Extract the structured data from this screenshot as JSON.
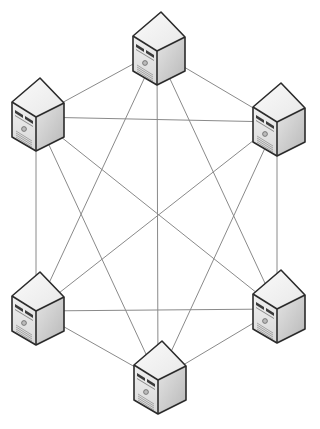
{
  "diagram": {
    "type": "full-mesh-network",
    "node_count": 6,
    "colors": {
      "background": "#ffffff",
      "link": "#8a8a8a",
      "outline": "#2b2b2b",
      "top_face": "#f2f2f2",
      "front_face": "#e6e6e6",
      "side_face": "#c9c9c9"
    },
    "nodes": [
      {
        "id": "server-top",
        "icon": "server-tower-icon",
        "hub": [
          157,
          51
        ]
      },
      {
        "id": "server-top-left",
        "icon": "server-tower-icon",
        "hub": [
          36,
          117
        ]
      },
      {
        "id": "server-top-right",
        "icon": "server-tower-icon",
        "hub": [
          277,
          122
        ]
      },
      {
        "id": "server-bottom-left",
        "icon": "server-tower-icon",
        "hub": [
          36,
          311
        ]
      },
      {
        "id": "server-bottom-right",
        "icon": "server-tower-icon",
        "hub": [
          277,
          309
        ]
      },
      {
        "id": "server-bottom",
        "icon": "server-tower-icon",
        "hub": [
          158,
          380
        ]
      }
    ],
    "links": [
      [
        "server-top",
        "server-top-left"
      ],
      [
        "server-top",
        "server-top-right"
      ],
      [
        "server-top",
        "server-bottom-left"
      ],
      [
        "server-top",
        "server-bottom-right"
      ],
      [
        "server-top",
        "server-bottom"
      ],
      [
        "server-top-left",
        "server-top-right"
      ],
      [
        "server-top-left",
        "server-bottom-left"
      ],
      [
        "server-top-left",
        "server-bottom-right"
      ],
      [
        "server-top-left",
        "server-bottom"
      ],
      [
        "server-top-right",
        "server-bottom-left"
      ],
      [
        "server-top-right",
        "server-bottom-right"
      ],
      [
        "server-top-right",
        "server-bottom"
      ],
      [
        "server-bottom-left",
        "server-bottom-right"
      ],
      [
        "server-bottom-left",
        "server-bottom"
      ],
      [
        "server-bottom-right",
        "server-bottom"
      ]
    ]
  }
}
